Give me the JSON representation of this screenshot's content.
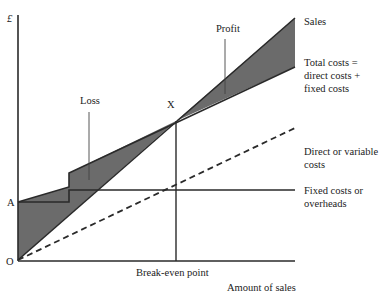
{
  "diagram": {
    "y_axis_label": "£",
    "x_axis_label": "Amount of sales",
    "origin_label": "O",
    "fixed_cost_point_label": "A",
    "break_even_marker": "X",
    "break_even_label": "Break-even point",
    "region_labels": {
      "loss": "Loss",
      "profit": "Profit"
    },
    "line_labels": {
      "sales": "Sales",
      "total_costs": [
        "Total costs =",
        "direct costs +",
        "fixed costs"
      ],
      "direct_costs": [
        "Direct or variable",
        "costs"
      ],
      "fixed_costs": [
        "Fixed costs or",
        "overheads"
      ]
    },
    "colors": {
      "shade": "#6b6b6b",
      "line": "#2a2a2a",
      "background": "#ffffff"
    }
  }
}
